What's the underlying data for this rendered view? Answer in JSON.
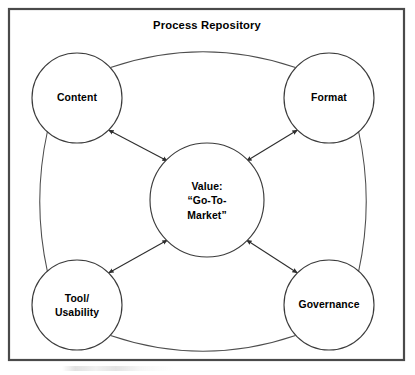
{
  "diagram": {
    "title": "Process Repository",
    "type": "hub-and-spoke",
    "frame": {
      "x": 9,
      "y": 9,
      "width": 395,
      "height": 351,
      "stroke_color": "#4a4a4a"
    },
    "title_position": {
      "x": 207,
      "y": 25
    },
    "center_node": {
      "id": "value",
      "lines": [
        "Value:",
        "“Go-To-",
        "Market”"
      ],
      "cx": 207,
      "cy": 200,
      "r": 57
    },
    "nodes": [
      {
        "id": "content",
        "lines": [
          "Content"
        ],
        "cx": 77,
        "cy": 98,
        "r": 45
      },
      {
        "id": "format",
        "lines": [
          "Format"
        ],
        "cx": 329,
        "cy": 98,
        "r": 45
      },
      {
        "id": "tool",
        "lines": [
          "Tool/",
          "Usability"
        ],
        "cx": 77,
        "cy": 305,
        "r": 45
      },
      {
        "id": "governance",
        "lines": [
          "Governance"
        ],
        "cx": 329,
        "cy": 305,
        "r": 45
      }
    ],
    "spokes": [
      {
        "id": "content-value",
        "from": "content",
        "to": "value",
        "double_headed": true
      },
      {
        "id": "format-value",
        "from": "format",
        "to": "value",
        "double_headed": true
      },
      {
        "id": "tool-value",
        "from": "tool",
        "to": "value",
        "double_headed": true
      },
      {
        "id": "governance-value",
        "from": "governance",
        "to": "value",
        "double_headed": true
      }
    ],
    "arcs": [
      {
        "id": "content-format",
        "from": "content",
        "to": "format",
        "side": "top"
      },
      {
        "id": "content-tool",
        "from": "content",
        "to": "tool",
        "side": "left"
      },
      {
        "id": "format-governance",
        "from": "format",
        "to": "governance",
        "side": "right"
      },
      {
        "id": "tool-governance",
        "from": "tool",
        "to": "governance",
        "side": "bottom"
      }
    ],
    "colors": {
      "background": "#ffffff",
      "frame": "#4a4a4a",
      "circle_stroke": "#3c3c3c",
      "arc_stroke": "#4d4d4d",
      "arrow_stroke": "#2e2e2e",
      "text": "#000000"
    }
  }
}
